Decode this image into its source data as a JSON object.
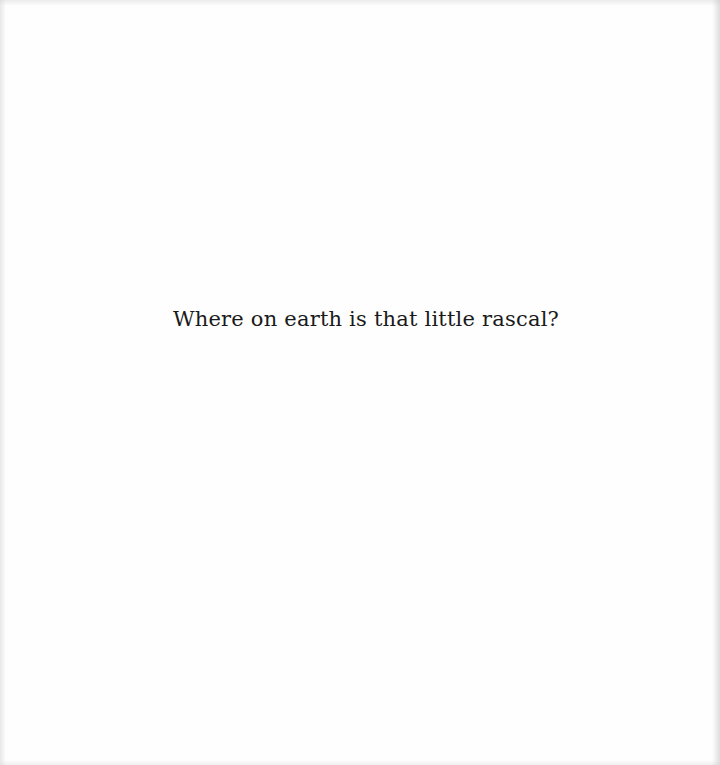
{
  "page": {
    "text": "Where on earth is that little rascal?",
    "background_color": "#fefefe",
    "text_color": "#1a1a1a"
  }
}
